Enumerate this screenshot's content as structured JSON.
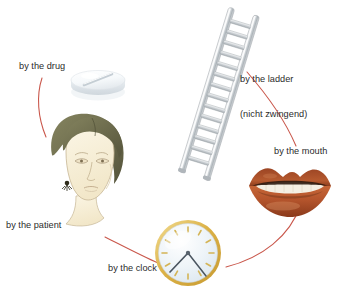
{
  "diagram": {
    "background_color": "#ffffff",
    "text_color": "#2b2b2b",
    "arrow_color": "#c0392b",
    "nodes": [
      {
        "id": "drug",
        "label": "by the drug",
        "icon": "pill-tablet-icon",
        "colors": {
          "body": "#f4f7f9",
          "shadow": "#d8dde2",
          "score": "#c9d0d6"
        }
      },
      {
        "id": "ladder",
        "label_line1": "by the ladder",
        "label_line2": "(nicht zwingend)",
        "icon": "ladder-icon",
        "rungs": 14,
        "colors": {
          "rail": "#b9bfc4",
          "rail_light": "#e9ecee",
          "rung": "#c6cbcf"
        }
      },
      {
        "id": "mouth",
        "label": "by the mouth",
        "icon": "lips-mouth-icon",
        "colors": {
          "lips": "#b4542c",
          "lips_dark": "#8c3c1c",
          "teeth": "#f3efe6",
          "inner": "#3a2418"
        }
      },
      {
        "id": "clock",
        "label": "by the clock",
        "icon": "analog-clock-icon",
        "colors": {
          "rim": "#e0b84a",
          "face": "#eef4f8",
          "ticks": "#d9bb5e",
          "hands": "#4a5560"
        }
      },
      {
        "id": "patient",
        "label": "by the patient",
        "icon": "patient-head-icon",
        "colors": {
          "hair": "#6e6d4e",
          "skin": "#f7efd9",
          "outline": "#b9a98a"
        }
      }
    ]
  }
}
